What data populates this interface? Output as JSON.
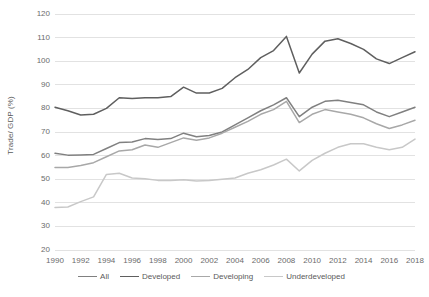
{
  "chart_data": {
    "type": "line",
    "title": "",
    "xlabel": "",
    "ylabel": "Trade/ GDP (%)",
    "ylim": [
      20,
      120
    ],
    "ytick_step": 10,
    "yticks": [
      20,
      30,
      40,
      50,
      60,
      70,
      80,
      90,
      100,
      110,
      120
    ],
    "grid": true,
    "grid_axis": "y",
    "legend_position": "bottom",
    "x": [
      1990,
      1991,
      1992,
      1993,
      1994,
      1995,
      1996,
      1997,
      1998,
      1999,
      2000,
      2001,
      2002,
      2003,
      2004,
      2005,
      2006,
      2007,
      2008,
      2009,
      2010,
      2011,
      2012,
      2013,
      2014,
      2015,
      2016,
      2017,
      2018
    ],
    "xtick_labels": [
      "1990",
      "1992",
      "1994",
      "1996",
      "1998",
      "2000",
      "2002",
      "2004",
      "2006",
      "2008",
      "2010",
      "2012",
      "2014",
      "2016",
      "2018"
    ],
    "xlim": [
      1990,
      2018
    ],
    "series": [
      {
        "name": "All",
        "color": "#808080",
        "values": [
          61,
          60.2,
          60.3,
          60.5,
          63,
          65.5,
          65.8,
          67.2,
          66.8,
          67.2,
          69.5,
          68,
          68.5,
          70,
          73,
          76,
          79,
          81.5,
          84.5,
          76.5,
          80.5,
          83,
          83.5,
          82.5,
          81.5,
          78.5,
          76.5,
          78.5,
          80.5
        ]
      },
      {
        "name": "Developed",
        "color": "#5f5f5f",
        "values": [
          80.5,
          79,
          77.2,
          77.5,
          80,
          84.5,
          84.2,
          84.5,
          84.5,
          85,
          89,
          86.5,
          86.5,
          88.5,
          93,
          96.5,
          101.5,
          104.5,
          110.5,
          95,
          103,
          108.5,
          109.5,
          107.5,
          105,
          101,
          99,
          101.5,
          104
        ]
      },
      {
        "name": "Developing",
        "color": "#a8a8a8",
        "values": [
          55,
          55,
          55.8,
          57,
          59.5,
          62,
          62.5,
          64.5,
          63.5,
          65.5,
          67.5,
          66.5,
          67.5,
          69.5,
          72,
          74.5,
          77.5,
          79.5,
          83,
          74,
          77.5,
          79.5,
          78.5,
          77.5,
          76,
          73.5,
          71.5,
          73,
          75
        ]
      },
      {
        "name": "Underdeveloped",
        "color": "#c8c8c8",
        "values": [
          38,
          38.2,
          40.5,
          42.5,
          52,
          52.5,
          50.5,
          50.2,
          49.5,
          49.5,
          49.8,
          49.2,
          49.5,
          50,
          50.5,
          52.5,
          54,
          56,
          58.5,
          53.5,
          58,
          61,
          63.5,
          65,
          65,
          63.5,
          62.5,
          63.5,
          67
        ]
      }
    ]
  },
  "axis": {
    "y_title": "Trade/ GDP (%)"
  },
  "legend": {
    "items": [
      {
        "label": "All"
      },
      {
        "label": "Developed"
      },
      {
        "label": "Developing"
      },
      {
        "label": "Underdeveloped"
      }
    ]
  }
}
